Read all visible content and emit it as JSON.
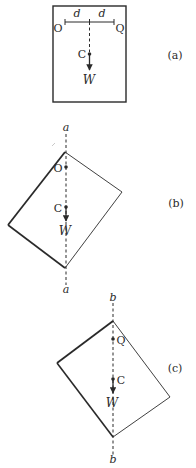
{
  "figure": {
    "panels": [
      {
        "id": "a",
        "caption": "(a)",
        "points": {
          "left_pivot": "O",
          "right_pivot": "Q",
          "center_of_mass": "C"
        },
        "dimension_labels": [
          "d",
          "d"
        ],
        "force_label": "W"
      },
      {
        "id": "b",
        "caption": "(b)",
        "axis_label_top": "a",
        "axis_label_bottom": "a",
        "points": {
          "pivot": "O",
          "center_of_mass": "C"
        },
        "force_label": "W"
      },
      {
        "id": "c",
        "caption": "(c)",
        "axis_label_top": "b",
        "axis_label_bottom": "b",
        "points": {
          "pivot": "Q",
          "center_of_mass": "C"
        },
        "force_label": "W"
      }
    ],
    "colors": {
      "stroke": "#2a2a2a",
      "background": "#ffffff"
    }
  }
}
